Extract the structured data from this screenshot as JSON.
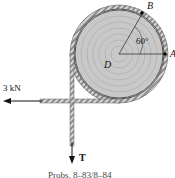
{
  "diagram": {
    "force_left_label": "3 kN",
    "tension_label": "T",
    "point_a_label": "A",
    "point_b_label": "B",
    "center_label": "D",
    "angle_label": "60°",
    "caption": "Probs. 8–83/8–84"
  },
  "colors": {
    "drum_fill": "#c9c9c9",
    "drum_rings": "#b3b3b3",
    "rope": "#9a9a9a",
    "arrow": "#111111"
  }
}
